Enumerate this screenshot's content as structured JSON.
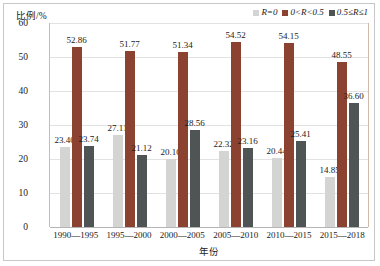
{
  "chart_data": {
    "type": "bar",
    "title": "",
    "xlabel": "年份",
    "ylabel": "比例/%",
    "ylim": [
      0,
      60
    ],
    "yticks": [
      0,
      10,
      20,
      30,
      40,
      50,
      60
    ],
    "grid": true,
    "legend_position": "top-right",
    "categories": [
      "1990—1995",
      "1995—2000",
      "2000—2005",
      "2005—2010",
      "2010—2015",
      "2015—2018"
    ],
    "series": [
      {
        "name": "R=0",
        "color": "#d4d4d2",
        "values": [
          23.4,
          27.11,
          20.1,
          22.32,
          20.44,
          14.85
        ]
      },
      {
        "name": "0<R<0.5",
        "color": "#8b4230",
        "values": [
          52.86,
          51.77,
          51.34,
          54.52,
          54.15,
          48.55
        ]
      },
      {
        "name": "0.5≤R≤1",
        "color": "#4e5554",
        "values": [
          23.74,
          21.12,
          28.56,
          23.16,
          25.41,
          36.6
        ]
      }
    ],
    "data_labels": [
      [
        "23.40",
        "52.86",
        "23.74"
      ],
      [
        "27.11",
        "51.77",
        "21.12"
      ],
      [
        "20.10",
        "51.34",
        "28.56"
      ],
      [
        "22.32",
        "54.52",
        "23.16"
      ],
      [
        "20.44",
        "54.15",
        "25.41"
      ],
      [
        "14.85",
        "48.55",
        "36.60"
      ]
    ],
    "ytick_labels": [
      "60",
      "50",
      "40",
      "30",
      "20",
      "10",
      "0"
    ]
  },
  "legend": {
    "items": [
      {
        "label": "R=0",
        "color": "#d4d4d2"
      },
      {
        "label": "0<R<0.5",
        "color": "#8b4230"
      },
      {
        "label": "0.5≤R≤1",
        "color": "#4e5554"
      }
    ]
  },
  "axes": {
    "y_title": "比例/%",
    "x_title": "年份"
  }
}
